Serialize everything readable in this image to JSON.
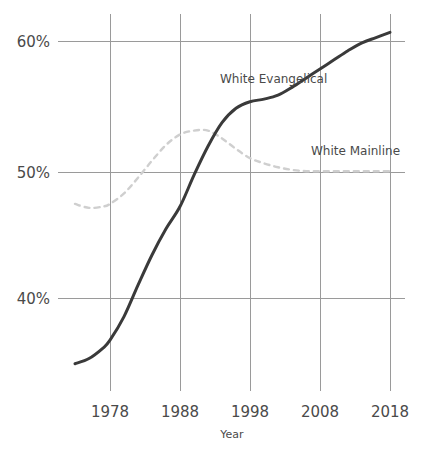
{
  "chart_data": {
    "type": "line",
    "title": "",
    "subtitle": "",
    "xlabel": "Year",
    "ylabel": "",
    "xlim": [
      1973,
      2018
    ],
    "ylim": [
      35.2,
      62.0
    ],
    "grid": true,
    "legend_position": "inline-annotations",
    "x_ticks": [
      "1978",
      "1988",
      "1998",
      "2008",
      "2018"
    ],
    "x_tick_values": [
      1978,
      1988,
      1998,
      2008,
      2018
    ],
    "y_ticks": [
      "40%",
      "50%",
      "60%"
    ],
    "y_tick_values": [
      40,
      50,
      60
    ],
    "x": [
      1973,
      1975,
      1977,
      1978,
      1980,
      1982,
      1984,
      1986,
      1988,
      1990,
      1992,
      1994,
      1996,
      1998,
      2000,
      2002,
      2004,
      2006,
      2008,
      2010,
      2012,
      2014,
      2016,
      2018
    ],
    "series": [
      {
        "name": "White Evangelical",
        "label": "White Evangelical",
        "style": "solid",
        "color": "#3a3a3a",
        "values": [
          35.4,
          35.8,
          36.6,
          37.2,
          39.0,
          41.4,
          43.7,
          45.7,
          47.4,
          49.8,
          52.0,
          53.8,
          54.9,
          55.4,
          55.6,
          55.9,
          56.5,
          57.2,
          57.9,
          58.6,
          59.3,
          59.9,
          60.3,
          60.7
        ],
        "annotation": {
          "text": "White Evangelical",
          "x_px": 220,
          "y_px": 83
        }
      },
      {
        "name": "White Mainline",
        "label": "White Mainline",
        "style": "dashed",
        "color": "#cfcfcf",
        "values": [
          47.6,
          47.3,
          47.4,
          47.6,
          48.4,
          49.6,
          50.9,
          52.1,
          52.9,
          53.2,
          53.2,
          52.6,
          51.8,
          51.1,
          50.7,
          50.4,
          50.2,
          50.1,
          50.1,
          50.1,
          50.1,
          50.1,
          50.1,
          50.1
        ],
        "annotation": {
          "text": "White Mainline",
          "x_px": 311,
          "y_px": 155
        }
      }
    ],
    "axis_colors": {
      "gridline": "#9a9a9a",
      "tick_text": "#4a4a4a",
      "background": "#ffffff"
    }
  },
  "labels": {
    "y_60": "60%",
    "y_50": "50%",
    "y_40": "40%",
    "x_1978": "1978",
    "x_1988": "1988",
    "x_1998": "1998",
    "x_2008": "2008",
    "x_2018": "2018",
    "x_axis_title": "Year",
    "series_evangelical": "White Evangelical",
    "series_mainline": "White Mainline"
  }
}
